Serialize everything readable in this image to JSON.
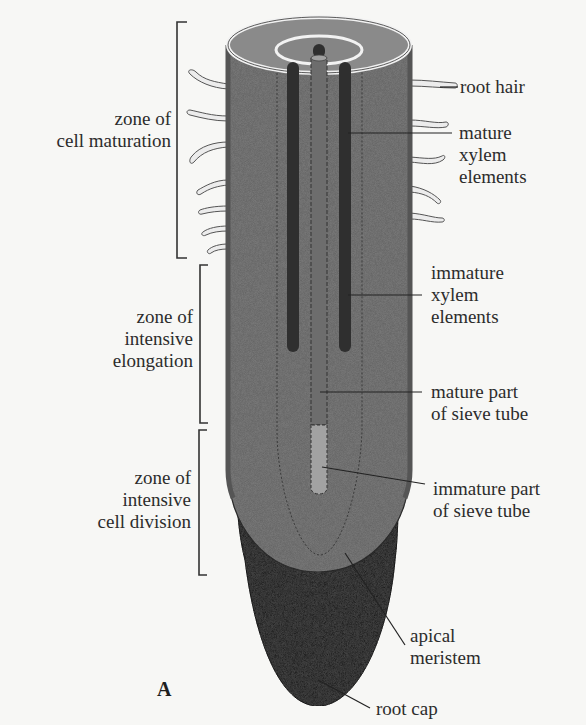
{
  "figure": {
    "panel_letter": "A",
    "colors": {
      "background": "#f7f7f5",
      "root_body": "#7d7d7d",
      "root_cap": "#4a4a4a",
      "xylem": "#2f2f2f",
      "sieve_mature": "#6a6a6a",
      "sieve_immature": "#9a9a9a",
      "root_hair": "#e8e8e8",
      "leader_line": "#222222"
    }
  },
  "zones": [
    {
      "id": "maturation",
      "lines": [
        "zone of",
        "cell maturation"
      ]
    },
    {
      "id": "elongation",
      "lines": [
        "zone of",
        "intensive",
        "elongation"
      ]
    },
    {
      "id": "division",
      "lines": [
        "zone of",
        "intensive",
        "cell division"
      ]
    }
  ],
  "labels": [
    {
      "id": "root-hair",
      "lines": [
        "root hair"
      ]
    },
    {
      "id": "mature-xylem",
      "lines": [
        "mature",
        "xylem",
        "elements"
      ]
    },
    {
      "id": "immature-xylem",
      "lines": [
        "immature",
        "xylem",
        "elements"
      ]
    },
    {
      "id": "mature-sieve",
      "lines": [
        "mature part",
        "of sieve tube"
      ]
    },
    {
      "id": "immature-sieve",
      "lines": [
        "immature part",
        "of sieve tube"
      ]
    },
    {
      "id": "apical-meristem",
      "lines": [
        "apical",
        "meristem"
      ]
    },
    {
      "id": "root-cap",
      "lines": [
        "root cap"
      ]
    }
  ]
}
